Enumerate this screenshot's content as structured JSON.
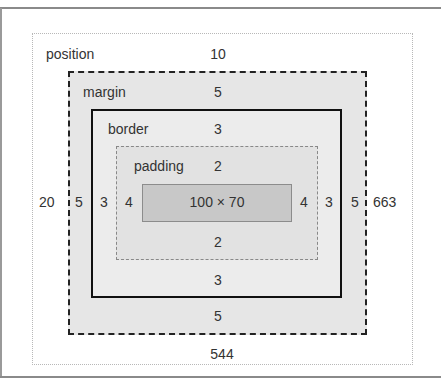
{
  "box_model": {
    "position": {
      "label": "position",
      "top": "10",
      "right": "663",
      "bottom": "544",
      "left": "20"
    },
    "margin": {
      "label": "margin",
      "top": "5",
      "right": "5",
      "bottom": "5",
      "left": "5"
    },
    "border": {
      "label": "border",
      "top": "3",
      "right": "3",
      "bottom": "3",
      "left": "3"
    },
    "padding": {
      "label": "padding",
      "top": "2",
      "right": "4",
      "bottom": "2",
      "left": "4"
    },
    "content": {
      "size": "100 × 70"
    }
  },
  "colors": {
    "margin_fill": "#e6e6e6",
    "border_fill": "#ececec",
    "padding_fill": "#e2e2e2",
    "content_fill": "#c8c8c8"
  }
}
